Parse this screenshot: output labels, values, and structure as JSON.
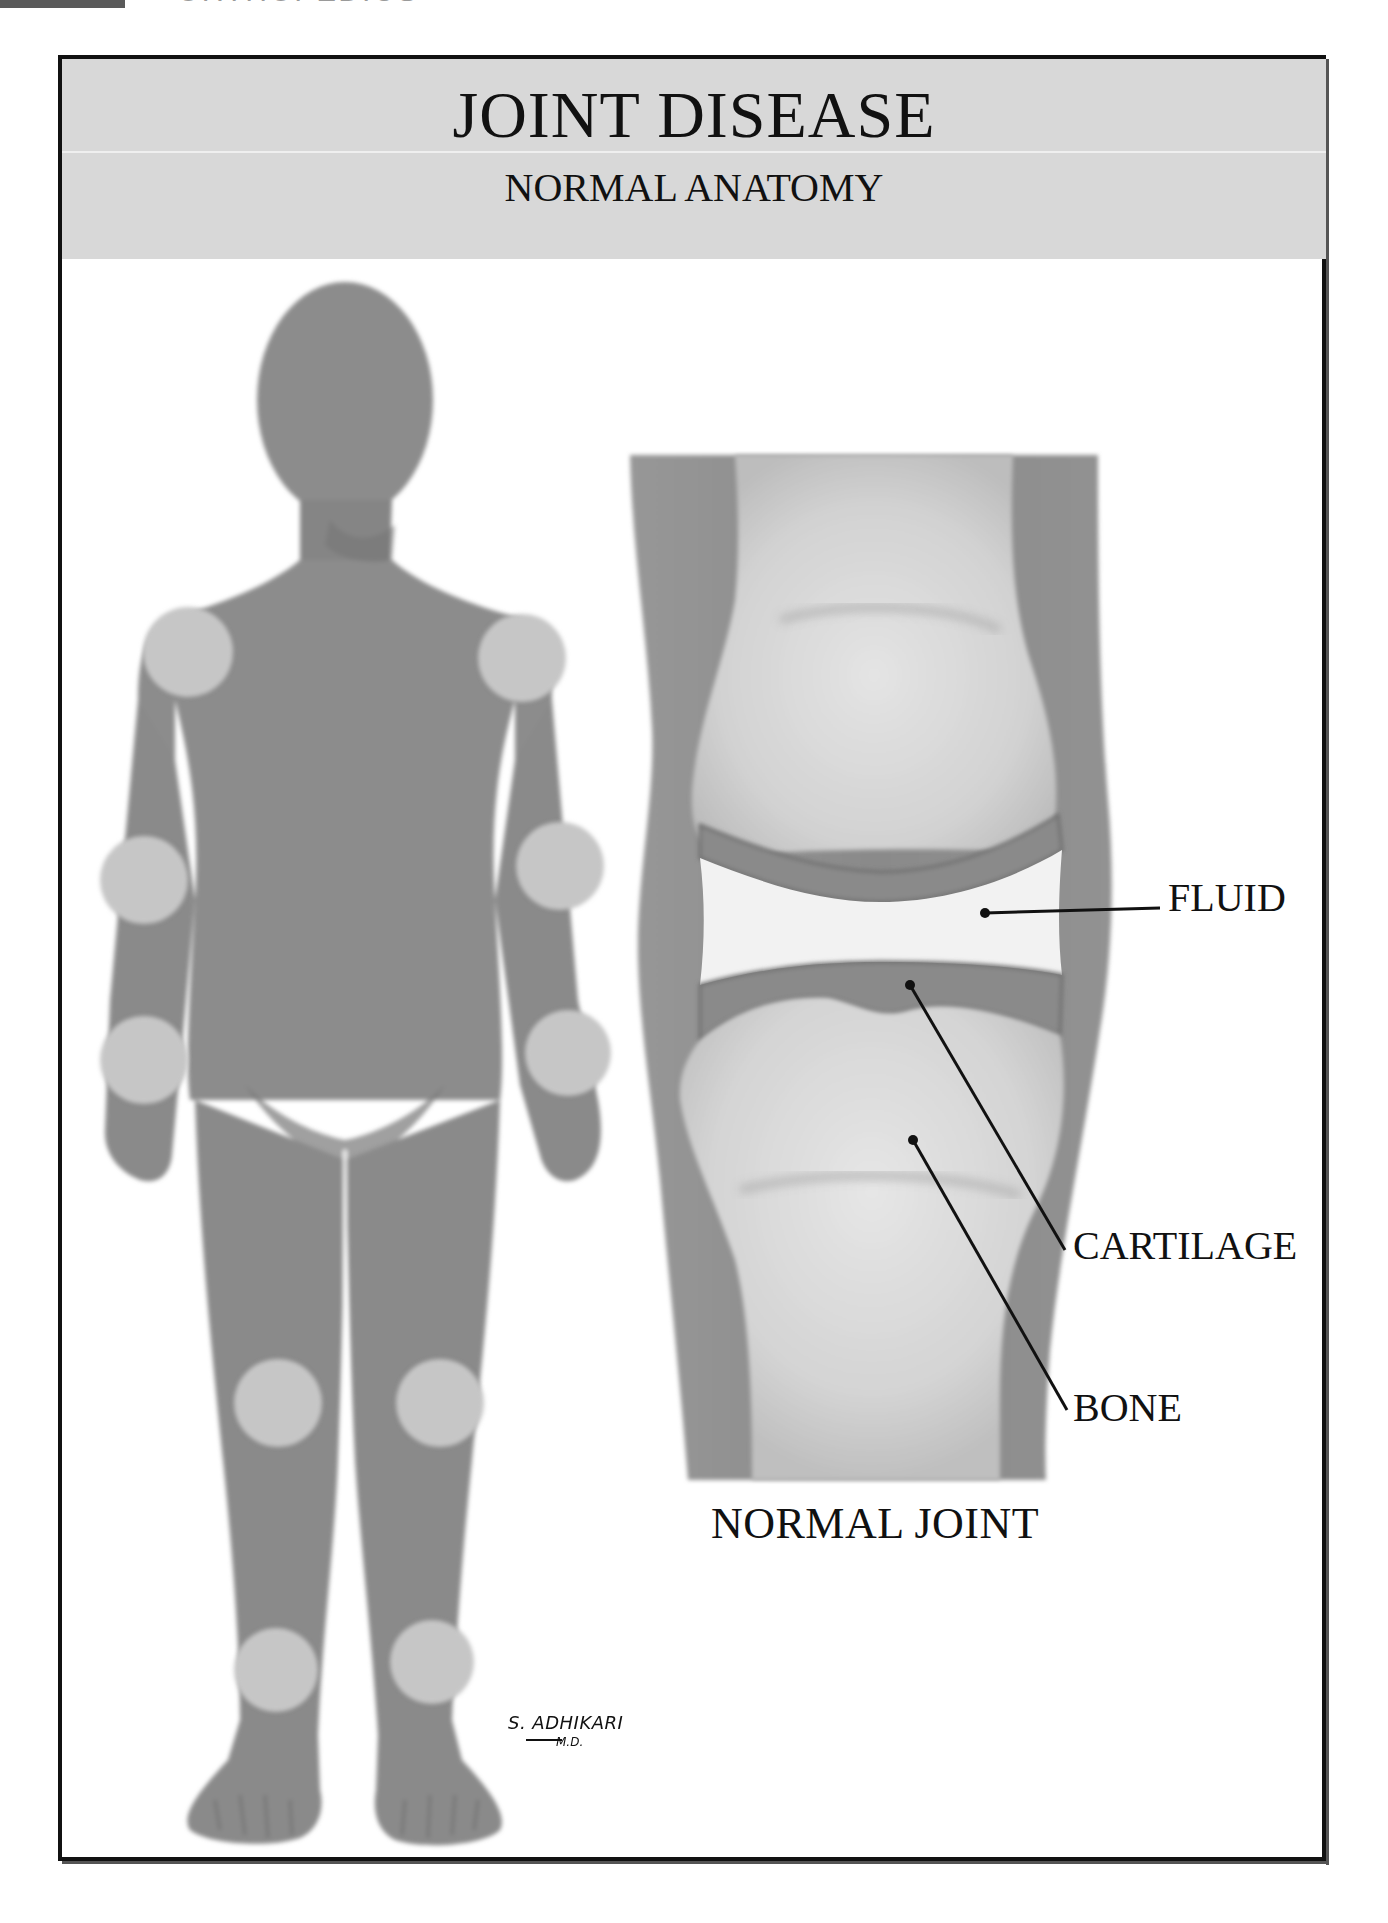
{
  "running_header": {
    "page_tab_color": "#5a5a5a",
    "section_text": "ORTHOPEDICS"
  },
  "header": {
    "title": "JOINT DISEASE",
    "subtitle": "NORMAL ANATOMY",
    "band_color": "#d8d8d8"
  },
  "figure": {
    "body_color": "#8c8c8c",
    "joint_highlight_color": "#c6c6c6",
    "highlighted_joints": [
      {
        "name": "right-shoulder"
      },
      {
        "name": "left-shoulder"
      },
      {
        "name": "right-elbow"
      },
      {
        "name": "left-elbow"
      },
      {
        "name": "right-wrist"
      },
      {
        "name": "left-wrist"
      },
      {
        "name": "right-knee"
      },
      {
        "name": "left-knee"
      },
      {
        "name": "right-ankle"
      },
      {
        "name": "left-ankle"
      }
    ]
  },
  "joint_diagram": {
    "caption": "NORMAL JOINT",
    "labels": {
      "fluid": "FLUID",
      "cartilage": "CARTILAGE",
      "bone": "BONE"
    },
    "colors": {
      "soft_tissue": "#8e8e8e",
      "bone": "#d6d6d6",
      "cartilage": "#8a8a8a",
      "fluid": "#f2f2f2"
    }
  },
  "signature": {
    "name": "S. ADHIKARI",
    "suffix": "M.D."
  }
}
